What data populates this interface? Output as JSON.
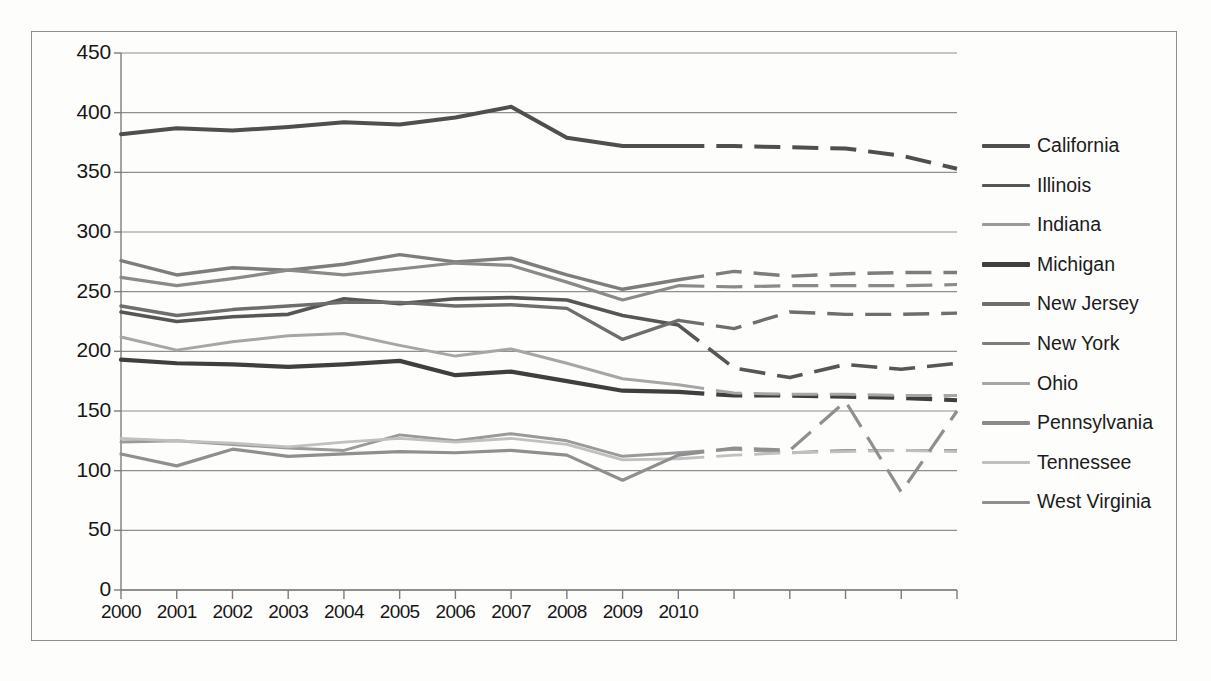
{
  "chart_data": {
    "type": "line",
    "title": "",
    "xlabel": "",
    "ylabel": "",
    "ylim": [
      0,
      450
    ],
    "ytick_labels": [
      "450",
      "400",
      "350",
      "300",
      "250",
      "200",
      "150",
      "100",
      "50",
      "0"
    ],
    "ytick_values": [
      450,
      400,
      350,
      300,
      250,
      200,
      150,
      100,
      50,
      0
    ],
    "grid": true,
    "legend_position": "right",
    "x": [
      2000,
      2001,
      2002,
      2003,
      2004,
      2005,
      2006,
      2007,
      2008,
      2009,
      2010,
      2011,
      2012,
      2013,
      2014,
      2015
    ],
    "categories": [
      "2000",
      "2001",
      "2002",
      "2003",
      "2004",
      "2005",
      "2006",
      "2007",
      "2008",
      "2009",
      "2010",
      "",
      "",
      "",
      "",
      ""
    ],
    "xtick_labels": [
      "2000",
      "2001",
      "2002",
      "2003",
      "2004",
      "2005",
      "2006",
      "2007",
      "2008",
      "2009",
      "2010"
    ],
    "solid_through": 2010,
    "forecast_note": "values after 2010 drawn as dashed projections",
    "series": [
      {
        "name": "California",
        "color": "#4f4f4f",
        "width": 4.0,
        "values": [
          382,
          387,
          385,
          388,
          392,
          390,
          396,
          405,
          379,
          372,
          372,
          372,
          371,
          370,
          364,
          353
        ]
      },
      {
        "name": "Illinois",
        "color": "#565656",
        "width": 3.6,
        "values": [
          233,
          225,
          229,
          231,
          244,
          240,
          244,
          245,
          243,
          230,
          222,
          186,
          178,
          189,
          185,
          190
        ]
      },
      {
        "name": "Indiana",
        "color": "#9a9a9a",
        "width": 3.0,
        "values": [
          124,
          125,
          122,
          119,
          117,
          130,
          125,
          131,
          125,
          112,
          115,
          118,
          115,
          117,
          117,
          117
        ]
      },
      {
        "name": "Michigan",
        "color": "#3f3f3f",
        "width": 4.2,
        "values": [
          193,
          190,
          189,
          187,
          189,
          192,
          180,
          183,
          175,
          167,
          166,
          163,
          163,
          162,
          161,
          159
        ]
      },
      {
        "name": "New Jersey",
        "color": "#6e6e6e",
        "width": 3.4,
        "values": [
          238,
          230,
          235,
          238,
          241,
          241,
          238,
          239,
          236,
          210,
          226,
          219,
          233,
          231,
          231,
          232
        ]
      },
      {
        "name": "New York",
        "color": "#7d7d7d",
        "width": 3.4,
        "values": [
          276,
          264,
          270,
          268,
          273,
          281,
          275,
          278,
          264,
          252,
          260,
          267,
          263,
          265,
          266,
          266
        ]
      },
      {
        "name": "Ohio",
        "color": "#a6a6a6",
        "width": 3.0,
        "values": [
          212,
          201,
          208,
          213,
          215,
          205,
          196,
          202,
          190,
          177,
          172,
          165,
          164,
          164,
          163,
          163
        ]
      },
      {
        "name": "Pennsylvania",
        "color": "#8a8a8a",
        "width": 3.2,
        "values": [
          262,
          255,
          261,
          268,
          264,
          269,
          274,
          272,
          258,
          243,
          255,
          254,
          255,
          255,
          255,
          256
        ]
      },
      {
        "name": "Tennessee",
        "color": "#c0c0c0",
        "width": 2.8,
        "values": [
          127,
          125,
          123,
          120,
          124,
          127,
          124,
          127,
          122,
          109,
          110,
          113,
          115,
          116,
          117,
          116
        ]
      },
      {
        "name": "West Virginia",
        "color": "#8f8f8f",
        "width": 3.2,
        "values": [
          114,
          104,
          118,
          112,
          114,
          116,
          115,
          117,
          113,
          92,
          113,
          119,
          117,
          158,
          82,
          150
        ]
      }
    ]
  },
  "legend": {
    "items": [
      {
        "label": "California"
      },
      {
        "label": "Illinois"
      },
      {
        "label": "Indiana"
      },
      {
        "label": "Michigan"
      },
      {
        "label": "New Jersey"
      },
      {
        "label": "New York"
      },
      {
        "label": "Ohio"
      },
      {
        "label": "Pennsylvania"
      },
      {
        "label": "Tennessee"
      },
      {
        "label": "West Virginia"
      }
    ]
  },
  "axis": {
    "line_color": "#7c7c7c",
    "grid_color": "#8f8f8f"
  }
}
